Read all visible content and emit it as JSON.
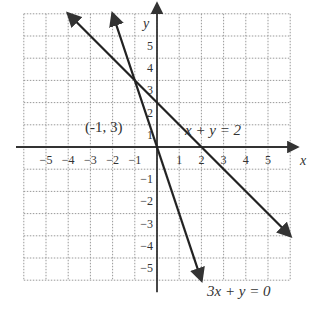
{
  "chart_data": {
    "type": "line",
    "title": "",
    "xlabel": "x",
    "ylabel": "y",
    "xlim": [
      -6,
      6
    ],
    "ylim": [
      -6,
      6
    ],
    "grid": true,
    "x_ticks": [
      "-5",
      "-4",
      "-3",
      "-2",
      "-1",
      "1",
      "2",
      "3",
      "4",
      "5"
    ],
    "y_ticks": [
      "5",
      "4",
      "3",
      "2",
      "1",
      "-1",
      "-2",
      "-3",
      "-4",
      "-5"
    ],
    "series": [
      {
        "name": "x + y = 2",
        "equation": "x + y = 2",
        "points": [
          [
            -4,
            6
          ],
          [
            6,
            -4
          ]
        ]
      },
      {
        "name": "3x + y = 0",
        "equation": "3x + y = 0",
        "points": [
          [
            -2,
            6
          ],
          [
            2,
            -6
          ]
        ]
      }
    ],
    "annotations": [
      {
        "text": "(-1, 3)",
        "x": -1,
        "y": 3
      },
      {
        "text": "x + y = 2",
        "label_for": "x + y = 2"
      },
      {
        "text": "3x + y = 0",
        "label_for": "3x + y = 0"
      }
    ],
    "intersection": [
      -1,
      3
    ]
  },
  "labels": {
    "x_axis": "x",
    "y_axis": "y",
    "point": "(-1, 3)",
    "eq1": "x + y = 2",
    "eq2": "3x + y = 0"
  }
}
